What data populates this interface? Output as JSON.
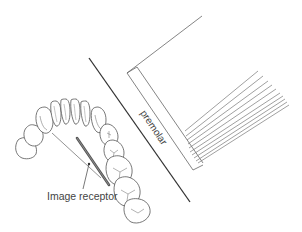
{
  "diagram": {
    "title": "",
    "labels": {
      "image_receptor": "Image receptor",
      "premolar": "premolar"
    },
    "colors": {
      "line": "#333333",
      "thin_line": "#777777",
      "receptor": "#555555",
      "background": "#ffffff"
    },
    "elements": [
      "dental-arch",
      "image-receptor",
      "x-ray-beam-ray",
      "divider-line",
      "receptor-holder-block",
      "parallel-lines"
    ]
  }
}
